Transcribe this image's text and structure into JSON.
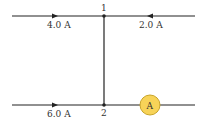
{
  "diagram": {
    "type": "circuit-junction",
    "nodes": [
      {
        "label": "1"
      },
      {
        "label": "2"
      }
    ],
    "currents": [
      {
        "label": "4.0 A",
        "wire": "top-left",
        "direction": "right"
      },
      {
        "label": "2.0 A",
        "wire": "top-right",
        "direction": "left"
      },
      {
        "label": "6.0 A",
        "wire": "bottom-left",
        "direction": "right"
      }
    ],
    "meter": {
      "label": "A",
      "type": "ammeter",
      "fill": "#f7d358"
    }
  }
}
